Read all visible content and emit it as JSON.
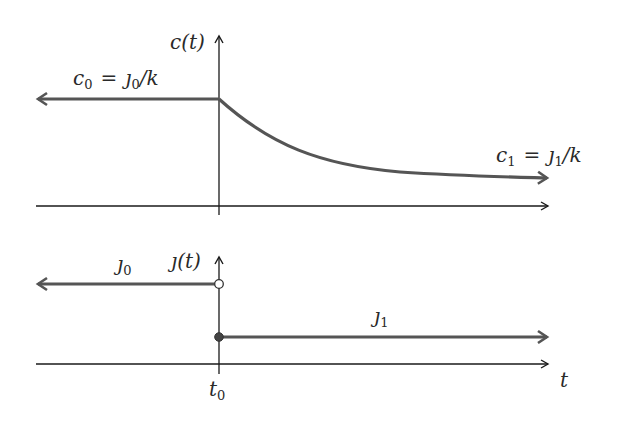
{
  "colors": {
    "axis": "#1a1a1a",
    "signal": "#555555",
    "background": "#ffffff"
  },
  "top_plot": {
    "y_axis_label": "c(t)",
    "left_label": {
      "lhs": "c",
      "lhs_sub": "0",
      "eq": "=",
      "rhs": "ȷ",
      "rhs_sub": "0",
      "tail": "/k"
    },
    "right_label": {
      "lhs": "c",
      "lhs_sub": "1",
      "eq": "=",
      "rhs": "ȷ",
      "rhs_sub": "1",
      "tail": "/k"
    },
    "description": "Constant c0 for t < t0, exponential decay toward c1 for t > t0"
  },
  "bottom_plot": {
    "y_axis_label": "ȷ(t)",
    "left_label": {
      "sym": "ȷ",
      "sub": "0"
    },
    "right_label": {
      "sym": "ȷ",
      "sub": "1"
    },
    "description": "Step function: j0 for t < t0 (open circle at t0), j1 for t >= t0 (filled circle at t0)"
  },
  "x_axis": {
    "label": "t",
    "tick_label": {
      "sym": "t",
      "sub": "0"
    }
  }
}
